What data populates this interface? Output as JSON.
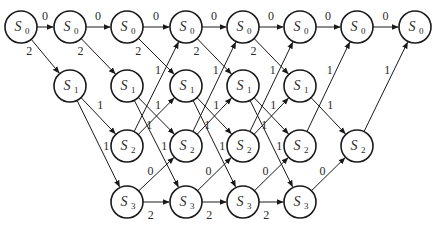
{
  "diagram": {
    "type": "trellis",
    "states": [
      {
        "id": "S0",
        "symbol": "S",
        "index": "0"
      },
      {
        "id": "S1",
        "symbol": "S",
        "index": "1"
      },
      {
        "id": "S2",
        "symbol": "S",
        "index": "2"
      },
      {
        "id": "S3",
        "symbol": "S",
        "index": "3"
      }
    ],
    "stages": [
      [
        "S0"
      ],
      [
        "S0",
        "S1"
      ],
      [
        "S0",
        "S1",
        "S2",
        "S3"
      ],
      [
        "S0",
        "S1",
        "S2",
        "S3"
      ],
      [
        "S0",
        "S1",
        "S2",
        "S3"
      ],
      [
        "S0",
        "S1",
        "S2",
        "S3"
      ],
      [
        "S0",
        "S2"
      ],
      [
        "S0"
      ]
    ],
    "transitions": [
      {
        "from": "S0",
        "to": "S0",
        "label": "0"
      },
      {
        "from": "S0",
        "to": "S1",
        "label": "2"
      },
      {
        "from": "S1",
        "to": "S2",
        "label": "1"
      },
      {
        "from": "S1",
        "to": "S3",
        "label": "1"
      },
      {
        "from": "S2",
        "to": "S0",
        "label": "1"
      },
      {
        "from": "S2",
        "to": "S1",
        "label": "1"
      },
      {
        "from": "S3",
        "to": "S2",
        "label": "0"
      },
      {
        "from": "S3",
        "to": "S3",
        "label": "2"
      }
    ]
  }
}
